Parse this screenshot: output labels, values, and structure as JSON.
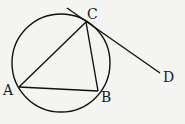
{
  "diagram": {
    "type": "geometry",
    "stroke_color": "#111111",
    "background": "#f4f4f2",
    "circle": {
      "cx": 61,
      "cy": 63,
      "r": 49
    },
    "points": {
      "A": {
        "label": "A",
        "x": 19,
        "y": 87,
        "label_x": 3,
        "label_y": 95
      },
      "B": {
        "label": "B",
        "x": 98,
        "y": 91,
        "label_x": 101,
        "label_y": 102
      },
      "C": {
        "label": "C",
        "x": 86,
        "y": 22,
        "label_x": 87,
        "label_y": 19
      },
      "D": {
        "label": "D",
        "x": 160,
        "y": 73,
        "label_x": 163,
        "label_y": 82
      }
    },
    "segments": [
      {
        "name": "AC",
        "from": "A",
        "to": "C"
      },
      {
        "name": "AB",
        "from": "A",
        "to": "B"
      },
      {
        "name": "CB",
        "from": "C",
        "to": "B"
      }
    ],
    "tangent": {
      "name": "tangent-CD",
      "x1": 67,
      "y1": 8,
      "x2": 160,
      "y2": 73
    }
  }
}
